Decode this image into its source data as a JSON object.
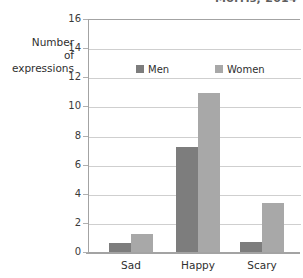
{
  "citation": {
    "text": "Morris, 2014"
  },
  "axis_title": {
    "line1": "Number",
    "line2": "of",
    "line3": "expressions"
  },
  "legend": {
    "position": "inside-top-center",
    "entries": [
      {
        "label": "Men",
        "color": "#7d7d7d",
        "swatch_icon": "square-swatch-icon"
      },
      {
        "label": "Women",
        "color": "#a8a8a8",
        "swatch_icon": "square-swatch-icon"
      }
    ]
  },
  "chart_data": {
    "type": "bar",
    "title": "",
    "subtitle": "",
    "xlabel": "",
    "ylabel": "Number of expressions",
    "categories": [
      "Sad",
      "Happy",
      "Scary"
    ],
    "series": [
      {
        "name": "Men",
        "color": "#7d7d7d",
        "values": [
          0.65,
          7.2,
          0.7
        ]
      },
      {
        "name": "Women",
        "color": "#a8a8a8",
        "values": [
          1.25,
          10.9,
          3.4
        ]
      }
    ],
    "ylim": [
      0,
      16
    ],
    "ytick_step": 2,
    "ytick_labels": [
      "0",
      "2",
      "4",
      "6",
      "8",
      "10",
      "12",
      "14",
      "16"
    ],
    "ytick_values": [
      0,
      2,
      4,
      6,
      8,
      10,
      12,
      14,
      16
    ],
    "grid": true,
    "grid_axis": "y",
    "legend_position": "inside-top-center",
    "bar_group_gap": true
  }
}
